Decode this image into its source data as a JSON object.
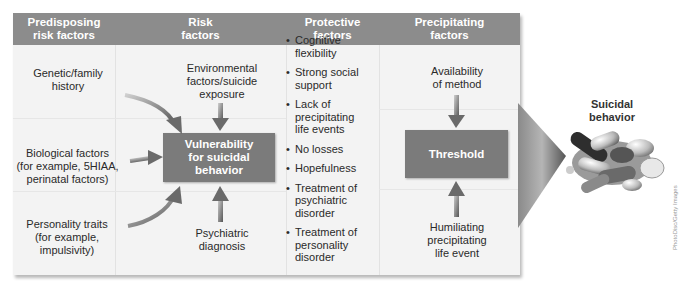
{
  "columns": [
    {
      "header": "Predisposing\nrisk factors"
    },
    {
      "header": "Risk\nfactors"
    },
    {
      "header": "Protective\nfactors"
    },
    {
      "header": "Precipitating\nfactors"
    }
  ],
  "predisposing_factors": [
    {
      "label": "Genetic/family\nhistory"
    },
    {
      "label": "Biological factors\n(for example, 5HIAA,\nperinatal factors)"
    },
    {
      "label": "Personality traits\n(for example,\nimpulsivity)"
    }
  ],
  "risk_factors": {
    "top": "Environmental\nfactors/suicide\nexposure",
    "center_box": "Vulnerability\nfor suicidal\nbehavior",
    "bottom": "Psychiatric\ndiagnosis"
  },
  "protective_factors": [
    "Cognitive\nflexibility",
    "Strong social\nsupport",
    "Lack of\nprecipitating\nlife events",
    "No losses",
    "Hopefulness",
    "Treatment of\npsychiatric\ndisorder",
    "Treatment of\npersonality\ndisorder"
  ],
  "precipitating_factors": {
    "top": "Availability\nof method",
    "center_box": "Threshold",
    "bottom": "Humiliating\nprecipitating\nlife event"
  },
  "outcome": {
    "label": "Suicidal\nbehavior",
    "image": "pills-pile-image"
  },
  "credit": "PhotoDisc/Getty Images",
  "colors": {
    "header_bg": "#8c8c8c",
    "panel_bg": "#f3f3f3",
    "box_bg": "#7b7b7b",
    "arrow": "#6e6e6e"
  }
}
